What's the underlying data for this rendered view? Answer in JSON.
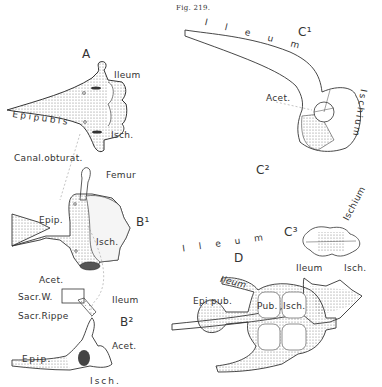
{
  "figure": {
    "number_label": "Fig. 219."
  },
  "panels": {
    "A": {
      "label": "A",
      "annotations": [
        "Ileum",
        "Epipubis",
        "Isch.",
        "Canal.obturat.",
        "Femur"
      ]
    },
    "B1": {
      "label": "B¹",
      "annotations": [
        "Epip.",
        "Isch.",
        "Acet."
      ]
    },
    "B2": {
      "label": "B²",
      "annotations": [
        "Sacr.W.",
        "Sacr.Rippe",
        "Ileum",
        "Acet.",
        "Epip.",
        "Isch."
      ]
    },
    "C1": {
      "label": "C¹",
      "annotations": [
        "Ileum",
        "Acet.",
        "Ischium"
      ]
    },
    "C2": {
      "label": "C²",
      "annotations": [
        "Ileum",
        "Ischium"
      ]
    },
    "C3": {
      "label": "C³",
      "annotations": [
        "Ileum",
        "Isch."
      ]
    },
    "D": {
      "label": "D",
      "annotations": [
        "Ileum",
        "Epi pub.",
        "Pub.",
        "Isch."
      ]
    }
  },
  "colors": {
    "background": "#ffffff",
    "ink": "#2a2a2a",
    "stipple": "#9a9a9a"
  }
}
